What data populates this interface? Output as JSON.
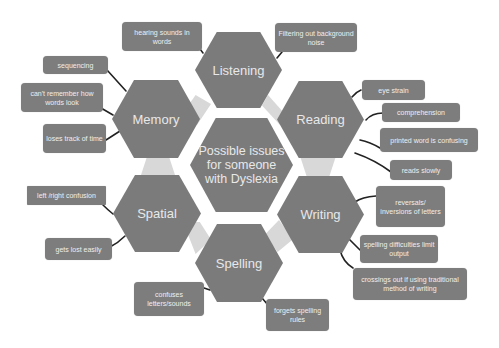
{
  "center": {
    "line1": "Possible issues",
    "line2": "for someone",
    "line3": "with Dyslexia"
  },
  "categories": [
    {
      "name": "Listening",
      "issues": [
        "hearing sounds  in words",
        "Filtering out background noise"
      ]
    },
    {
      "name": "Reading",
      "issues": [
        "eye strain",
        "comprehension",
        "printed word is confusing",
        "reads slowly"
      ]
    },
    {
      "name": "Writing",
      "issues": [
        "reversals/ inversions of letters",
        "spelling difficulties limit  output",
        "crossings out if using traditional method of writing"
      ]
    },
    {
      "name": "Spelling",
      "issues": [
        "confuses letters/sounds",
        "forgets spelling rules"
      ]
    },
    {
      "name": "Spatial",
      "issues": [
        "left /right confusion",
        "gets lost easily"
      ]
    },
    {
      "name": "Memory",
      "issues": [
        "sequencing",
        "can't remember how words look",
        "loses track of time"
      ]
    }
  ],
  "colors": {
    "hex_fill": "#7b7b7b",
    "box_fill": "#7d7d7d",
    "connector_fill": "#d8d8d8",
    "text": "#e8e8e8",
    "line": "#222222"
  }
}
